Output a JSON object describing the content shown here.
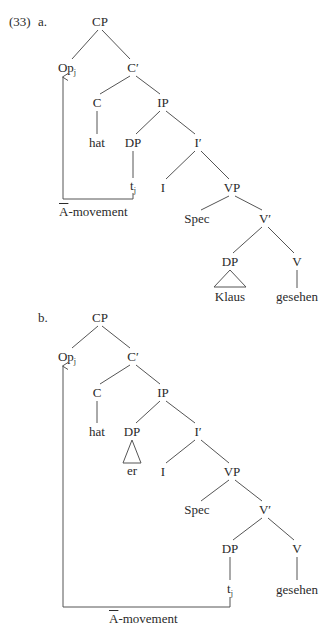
{
  "example_number": "(33)",
  "trees": [
    {
      "label": "a.",
      "nodes": {
        "cp": "CP",
        "op": "Op",
        "op_sub": "j",
        "cbar": "C′",
        "c": "C",
        "ip": "IP",
        "hat": "hat",
        "dp_subj": "DP",
        "ibar": "I′",
        "trace": "t",
        "trace_sub": "j",
        "i": "I",
        "vp": "VP",
        "spec": "Spec",
        "vbar": "V′",
        "dp_obj": "DP",
        "v": "V",
        "obj": "Klaus",
        "verb": "gesehen"
      },
      "movement_label_bar": "A",
      "movement_label_rest": "-movement"
    },
    {
      "label": "b.",
      "nodes": {
        "cp": "CP",
        "op": "Op",
        "op_sub": "j",
        "cbar": "C′",
        "c": "C",
        "ip": "IP",
        "hat": "hat",
        "dp_subj": "DP",
        "ibar": "I′",
        "subj": "er",
        "i": "I",
        "vp": "VP",
        "spec": "Spec",
        "vbar": "V′",
        "dp_obj": "DP",
        "v": "V",
        "trace": "t",
        "trace_sub": "j",
        "verb": "gesehen"
      },
      "movement_label_bar": "A",
      "movement_label_rest": "-movement"
    }
  ]
}
